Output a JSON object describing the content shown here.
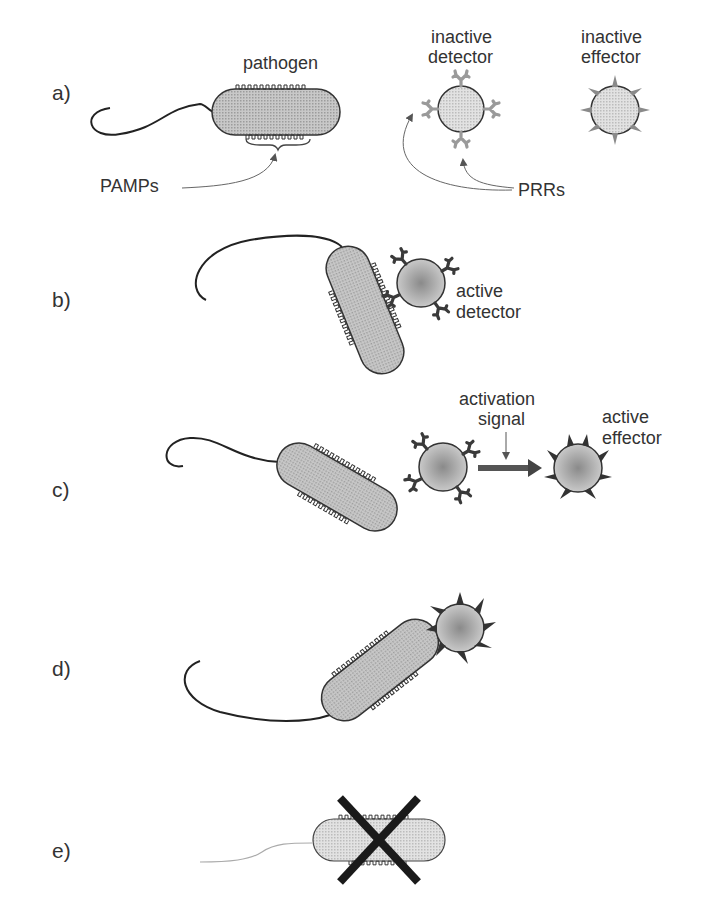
{
  "figure": {
    "panels": [
      {
        "id": "a",
        "label": "a)"
      },
      {
        "id": "b",
        "label": "b)"
      },
      {
        "id": "c",
        "label": "c)"
      },
      {
        "id": "d",
        "label": "d)"
      },
      {
        "id": "e",
        "label": "e)"
      }
    ],
    "labels": {
      "pathogen": "pathogen",
      "inactive_detector_1": "inactive",
      "inactive_detector_2": "detector",
      "inactive_effector_1": "inactive",
      "inactive_effector_2": "effector",
      "pamps": "PAMPs",
      "prrs": "PRRs",
      "active_detector_1": "active",
      "active_detector_2": "detector",
      "activation_signal_1": "activation",
      "activation_signal_2": "signal",
      "active_effector_1": "active",
      "active_effector_2": "effector"
    },
    "colors": {
      "cell_fill": "#bdbdbd",
      "inactive_fill": "#d4d4d4",
      "outline": "#333333",
      "receptor_inactive": "#9a9a9a",
      "receptor_active": "#3a3a3a",
      "cross": "#1a1a1a"
    }
  }
}
